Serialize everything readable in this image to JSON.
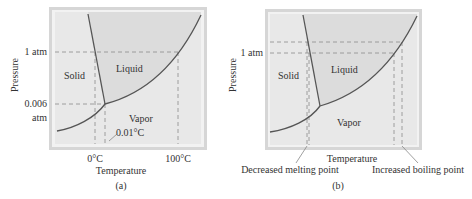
{
  "panels": [
    {
      "id": "a",
      "caption": "(a)",
      "xlabel": "Temperature",
      "ylabel": "Pressure",
      "y_ticks": [
        "1 atm",
        "0.006",
        "atm"
      ],
      "x_ticks": [
        "0°C",
        "100°C"
      ],
      "regions": [
        "Solid",
        "Liquid",
        "Vapor"
      ],
      "annotation": "0.01°C"
    },
    {
      "id": "b",
      "caption": "(b)",
      "xlabel": "Temperature",
      "ylabel": "Pressure",
      "y_ticks": [
        "1 atm"
      ],
      "regions": [
        "Solid",
        "Liquid",
        "Vapor"
      ],
      "annotations": [
        "Decreased melting point",
        "Increased boiling point"
      ]
    }
  ],
  "colors": {
    "frame": "#d9d9d9",
    "plot_bg": "#e9e9e9",
    "liquid_bg": "#dcdcdc",
    "curve": "#555555",
    "dashed": "#8a8a8a"
  }
}
